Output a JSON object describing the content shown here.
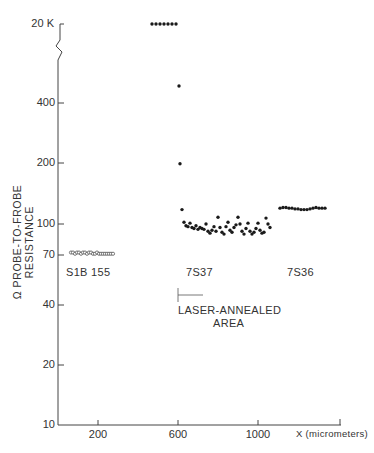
{
  "chart_data": {
    "type": "scatter",
    "title": "",
    "xlabel": "X (micrometers)",
    "ylabel": "Ω PROBE-TO-FROBE RESISTANCE",
    "yscale": "log",
    "ylim": [
      10,
      20000
    ],
    "axis_break": "between 400 and 20K",
    "y_ticks": [
      "10",
      "20",
      "40",
      "70",
      "100",
      "200",
      "400",
      "20 K"
    ],
    "x_ticks": [
      "200",
      "600",
      "1000"
    ],
    "xlim": [
      0,
      1400
    ],
    "grid": false,
    "series": [
      {
        "name": "S1B 155",
        "marker": "open-circle",
        "points": [
          [
            65,
            72
          ],
          [
            75,
            72
          ],
          [
            85,
            71
          ],
          [
            95,
            72
          ],
          [
            105,
            72
          ],
          [
            115,
            71
          ],
          [
            125,
            72
          ],
          [
            135,
            72
          ],
          [
            145,
            71
          ],
          [
            155,
            72
          ],
          [
            165,
            72
          ],
          [
            175,
            71
          ],
          [
            185,
            71
          ],
          [
            195,
            72
          ],
          [
            205,
            71
          ],
          [
            215,
            71
          ],
          [
            225,
            71
          ],
          [
            235,
            71
          ],
          [
            245,
            71
          ],
          [
            255,
            71
          ],
          [
            265,
            71
          ],
          [
            275,
            71
          ]
        ]
      },
      {
        "name": "7S37",
        "marker": "filled-circle",
        "points": [
          [
            470,
            20000
          ],
          [
            490,
            20000
          ],
          [
            510,
            20000
          ],
          [
            530,
            20000
          ],
          [
            550,
            20000
          ],
          [
            570,
            20000
          ],
          [
            590,
            20000
          ],
          [
            605,
            490
          ],
          [
            610,
            200
          ],
          [
            620,
            118
          ],
          [
            630,
            102
          ],
          [
            640,
            98
          ],
          [
            650,
            97
          ],
          [
            660,
            101
          ],
          [
            670,
            96
          ],
          [
            680,
            95
          ],
          [
            690,
            98
          ],
          [
            700,
            94
          ],
          [
            710,
            96
          ],
          [
            720,
            95
          ],
          [
            730,
            94
          ],
          [
            740,
            100
          ],
          [
            750,
            92
          ],
          [
            760,
            90
          ],
          [
            770,
            93
          ],
          [
            780,
            97
          ],
          [
            790,
            92
          ],
          [
            800,
            108
          ],
          [
            810,
            96
          ],
          [
            820,
            91
          ],
          [
            830,
            89
          ],
          [
            840,
            97
          ],
          [
            850,
            102
          ],
          [
            860,
            93
          ],
          [
            870,
            91
          ],
          [
            880,
            96
          ],
          [
            890,
            99
          ],
          [
            900,
            108
          ],
          [
            910,
            100
          ],
          [
            920,
            92
          ],
          [
            930,
            89
          ],
          [
            940,
            95
          ],
          [
            950,
            101
          ],
          [
            960,
            92
          ],
          [
            970,
            89
          ],
          [
            980,
            91
          ],
          [
            990,
            95
          ],
          [
            1000,
            101
          ],
          [
            1010,
            93
          ],
          [
            1020,
            90
          ],
          [
            1030,
            91
          ],
          [
            1040,
            107
          ],
          [
            1050,
            100
          ],
          [
            1060,
            96
          ]
        ]
      },
      {
        "name": "7S36",
        "marker": "filled-circle",
        "points": [
          [
            1110,
            120
          ],
          [
            1125,
            121
          ],
          [
            1140,
            121
          ],
          [
            1155,
            120
          ],
          [
            1170,
            120
          ],
          [
            1185,
            119
          ],
          [
            1200,
            119
          ],
          [
            1215,
            118
          ],
          [
            1230,
            118
          ],
          [
            1245,
            118
          ],
          [
            1260,
            119
          ],
          [
            1275,
            120
          ],
          [
            1290,
            121
          ],
          [
            1305,
            120
          ],
          [
            1320,
            120
          ],
          [
            1335,
            120
          ]
        ]
      }
    ],
    "annotations": [
      {
        "text": "S1B 155",
        "x": 150,
        "y": 60
      },
      {
        "text": "7S37",
        "x": 640,
        "y": 60
      },
      {
        "text": "7S36",
        "x": 1120,
        "y": 60
      },
      {
        "text": "LASER-ANNEALED AREA",
        "x": 600,
        "y": 45,
        "arrow": "right from x=600"
      }
    ]
  },
  "labels": {
    "ylabel": "Ω PROBE-TO-FROBE RESISTANCE",
    "xlabel": "X (micrometers)",
    "y20k": "20 K",
    "y400": "400",
    "y200": "200",
    "y100": "100",
    "y70": "70",
    "y40": "40",
    "y20": "20",
    "y10": "10",
    "x200": "200",
    "x600": "600",
    "x1000": "1000",
    "sample1": "S1B 155",
    "sample2": "7S37",
    "sample3": "7S36",
    "annealed1": "LASER-ANNEALED",
    "annealed2": "AREA",
    "caption": "Fig. 3 ..."
  }
}
